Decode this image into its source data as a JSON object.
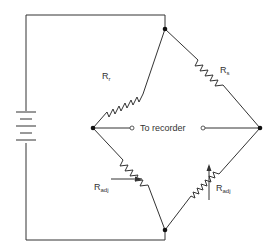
{
  "diagram": {
    "labels": {
      "r_r": {
        "main": "R",
        "sub": "r"
      },
      "r_s": {
        "main": "R",
        "sub": "s"
      },
      "r_adj_left": {
        "main": "R",
        "sub": "adj"
      },
      "r_adj_right": {
        "main": "R",
        "sub": "adj"
      },
      "output": "To recorder"
    },
    "components": [
      {
        "id": "battery",
        "type": "battery"
      },
      {
        "id": "r_r",
        "type": "resistor",
        "label": "Rr"
      },
      {
        "id": "r_s",
        "type": "resistor",
        "label": "Rs"
      },
      {
        "id": "r_adj_left",
        "type": "variable-resistor",
        "label": "Radj"
      },
      {
        "id": "r_adj_right",
        "type": "variable-resistor",
        "label": "Radj"
      },
      {
        "id": "recorder_terminals",
        "type": "output-terminals",
        "label": "To recorder"
      }
    ],
    "colors": {
      "line": "#333333",
      "background": "#ffffff"
    }
  }
}
